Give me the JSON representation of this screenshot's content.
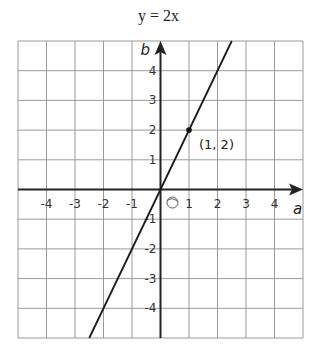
{
  "title": "y = 2x",
  "chart_data": {
    "type": "line",
    "title": "y = 2x",
    "xlabel": "a",
    "ylabel": "b",
    "xlim": [
      -5,
      5
    ],
    "ylim": [
      -5,
      5
    ],
    "grid": true,
    "x_ticks": [
      "-4",
      "-3",
      "-2",
      "-1",
      "1",
      "2",
      "3",
      "4"
    ],
    "y_ticks": [
      "4",
      "3",
      "2",
      "1",
      "-1",
      "-2",
      "-3",
      "-4"
    ],
    "origin_label": "O",
    "series": [
      {
        "name": "y = 2x",
        "x": [
          -2.5,
          2.5
        ],
        "y": [
          -5,
          5
        ]
      }
    ],
    "points": [
      {
        "x": 1,
        "y": 2,
        "label": "(1, 2)"
      }
    ]
  }
}
